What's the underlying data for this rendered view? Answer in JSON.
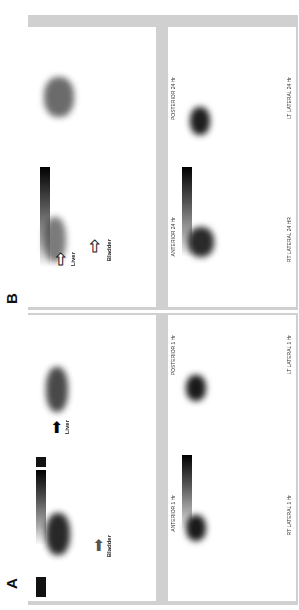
{
  "figure": {
    "panels": [
      {
        "label": "A",
        "views": [
          {
            "name": "ANTERIOR 1 Hr",
            "annotation": "Bladder",
            "colorbar_max": "77"
          },
          {
            "name": "POSTERIOR 1 Hr",
            "annotation": "Liver",
            "colorbar_max": "83"
          },
          {
            "name": "RT LATERAL 1 Hr",
            "colorbar_max": "100"
          },
          {
            "name": "LT LATERAL 1 Hr",
            "colorbar_max": "100"
          }
        ]
      },
      {
        "label": "B",
        "views": [
          {
            "name": "ANTERIOR 24 Hr",
            "annotations": [
              "Liver",
              "Bladder"
            ],
            "colorbar_max": "100"
          },
          {
            "name": "POSTERIOR 24 Hr",
            "colorbar_max": "100"
          },
          {
            "name": "RT LATERAL 24 HR",
            "colorbar_max": "100"
          },
          {
            "name": "LT LATERAL 24 Hr",
            "colorbar_max": "100"
          }
        ]
      }
    ],
    "colorbar_unit": "%",
    "colorbar_min": "0",
    "colors": {
      "panel_frame": "#d0d0d0",
      "background": "#ffffff",
      "scan": "#1a1a1a"
    }
  }
}
